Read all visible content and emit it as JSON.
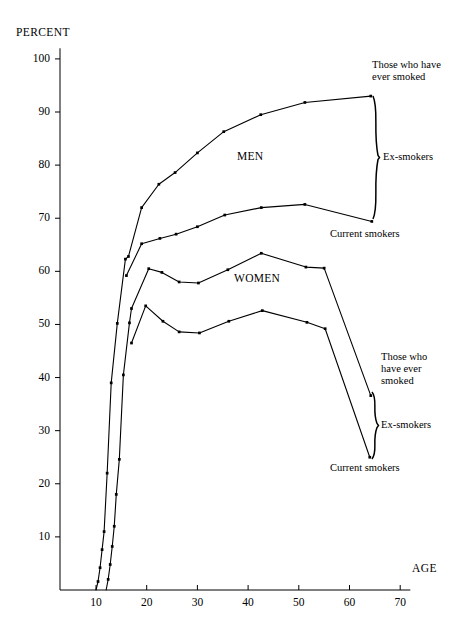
{
  "figure": {
    "y_axis_title": "PERCENT",
    "x_axis_title": "AGE",
    "group_labels": {
      "men": "MEN",
      "women": "WOMEN"
    },
    "annotations": {
      "men_ever_smoked": "Those who have\never smoked",
      "men_ex_smokers": "Ex-smokers",
      "men_current_smokers": "Current smokers",
      "women_ever_smoked": "Those who\nhave ever\nsmoked",
      "women_ex_smokers": "Ex-smokers",
      "women_current_smokers": "Current smokers"
    },
    "annotation_lines": {
      "men_ever_smoked_1": "Those who have",
      "men_ever_smoked_2": "ever smoked",
      "men_ex_smokers": "Ex-smokers",
      "men_current_smokers": "Current smokers",
      "women_ever_smoked_1": "Those who",
      "women_ever_smoked_2": "have ever",
      "women_ever_smoked_3": "smoked",
      "women_ex_smokers": "Ex-smokers",
      "women_current_smokers": "Current smokers"
    },
    "colors": {
      "ink": "#000000",
      "background": "#ffffff"
    }
  },
  "chart_data": {
    "type": "line",
    "title": "",
    "xlabel": "AGE",
    "ylabel": "PERCENT",
    "xlim": [
      6,
      72
    ],
    "ylim": [
      0,
      102
    ],
    "xticks": [
      10,
      20,
      30,
      40,
      50,
      60,
      70
    ],
    "yticks": [
      10,
      20,
      30,
      40,
      50,
      60,
      70,
      80,
      90,
      100
    ],
    "grid": false,
    "legend": "in-plot annotations with braces at right edge",
    "series": [
      {
        "name": "Men - those who have ever smoked",
        "group": "MEN",
        "points": [
          [
            10.0,
            0.0
          ],
          [
            10.4,
            1.6
          ],
          [
            10.8,
            4.2
          ],
          [
            11.2,
            7.6
          ],
          [
            11.6,
            11.0
          ],
          [
            12.2,
            22.0
          ],
          [
            13.0,
            39.0
          ],
          [
            14.2,
            50.2
          ],
          [
            15.8,
            62.3
          ],
          [
            16.4,
            62.8
          ],
          [
            19.0,
            72.0
          ],
          [
            22.4,
            76.4
          ],
          [
            25.6,
            78.6
          ],
          [
            30.0,
            82.3
          ],
          [
            35.2,
            86.3
          ],
          [
            42.5,
            89.5
          ],
          [
            51.2,
            91.8
          ],
          [
            64.2,
            93.0
          ]
        ]
      },
      {
        "name": "Men - current smokers",
        "group": "MEN",
        "points": [
          [
            16.0,
            59.2
          ],
          [
            19.0,
            65.2
          ],
          [
            22.6,
            66.2
          ],
          [
            25.8,
            67.0
          ],
          [
            30.0,
            68.4
          ],
          [
            35.4,
            70.6
          ],
          [
            42.6,
            72.0
          ],
          [
            51.2,
            72.6
          ],
          [
            64.4,
            69.4
          ]
        ]
      },
      {
        "name": "Women - those who have ever smoked",
        "group": "WOMEN",
        "points": [
          [
            12.0,
            0.0
          ],
          [
            12.4,
            2.0
          ],
          [
            12.8,
            4.8
          ],
          [
            13.2,
            8.2
          ],
          [
            13.6,
            12.0
          ],
          [
            14.0,
            18.0
          ],
          [
            14.6,
            24.6
          ],
          [
            15.4,
            40.5
          ],
          [
            16.6,
            50.3
          ],
          [
            17.0,
            53.0
          ],
          [
            20.4,
            60.5
          ],
          [
            23.0,
            59.8
          ],
          [
            26.4,
            58.0
          ],
          [
            30.2,
            57.8
          ],
          [
            36.0,
            60.3
          ],
          [
            42.6,
            63.4
          ],
          [
            51.4,
            60.8
          ],
          [
            55.0,
            60.6
          ],
          [
            64.2,
            36.6
          ]
        ]
      },
      {
        "name": "Women - current smokers",
        "group": "WOMEN",
        "points": [
          [
            17.0,
            46.5
          ],
          [
            19.8,
            53.5
          ],
          [
            23.2,
            50.6
          ],
          [
            26.4,
            48.6
          ],
          [
            30.4,
            48.4
          ],
          [
            36.2,
            50.6
          ],
          [
            42.8,
            52.6
          ],
          [
            51.6,
            50.4
          ],
          [
            55.2,
            49.2
          ],
          [
            64.0,
            25.0
          ]
        ]
      }
    ]
  }
}
